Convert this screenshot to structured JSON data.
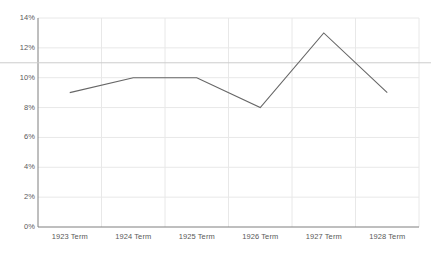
{
  "chart_data": {
    "type": "line",
    "title": "",
    "subtitle": "",
    "xlabel": "",
    "ylabel": "",
    "categories": [
      "1923 Term",
      "1924 Term",
      "1925 Term",
      "1926 Term",
      "1927 Term",
      "1928 Term"
    ],
    "series": [
      {
        "name": "",
        "values": [
          9,
          10,
          10,
          8,
          13,
          9
        ],
        "color": "#666666"
      }
    ],
    "ylim": [
      0,
      14
    ],
    "yticks": [
      0,
      2,
      4,
      6,
      8,
      10,
      12,
      14
    ],
    "ytick_labels": [
      "0%",
      "2%",
      "4%",
      "6%",
      "8%",
      "10%",
      "12%",
      "14%"
    ],
    "grid": true,
    "grid_color": "#e8e8e8",
    "axis_color": "#7f7f7f",
    "legend": "none",
    "reference_line": {
      "value": 11,
      "label": "",
      "color": "#cccccc"
    },
    "value_suffix": "%"
  }
}
